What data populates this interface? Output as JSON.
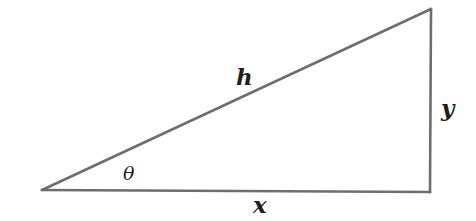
{
  "diagram": {
    "type": "right-triangle",
    "stroke_color": "#6e6e6e",
    "label_color": "#1e1e1e",
    "background": "#ffffff",
    "vertices": {
      "left": {
        "x": 42,
        "y": 190
      },
      "bottom_right": {
        "x": 430,
        "y": 192
      },
      "top_right": {
        "x": 431,
        "y": 9
      }
    },
    "labels": {
      "hypotenuse": "h",
      "opposite": "y",
      "adjacent": "x",
      "angle": "θ"
    }
  }
}
